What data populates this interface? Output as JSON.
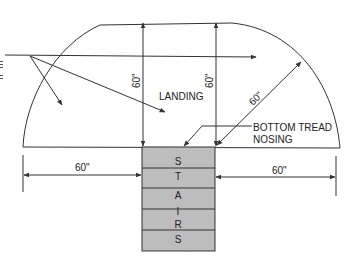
{
  "diagram": {
    "colors": {
      "line": "#333333",
      "stairs_fill": "#bdbdbd",
      "text": "#222222",
      "background": "#ffffff"
    },
    "labels": {
      "landing": "LANDING",
      "bottom_tread_nosing_line1": "BOTTOM TREAD",
      "bottom_tread_nosing_line2": "NOSING"
    },
    "dimensions": {
      "vertical_left": "60\"",
      "vertical_right": "60\"",
      "diagonal": "60\"",
      "horizontal_left": "60\"",
      "horizontal_right": "60\""
    },
    "stairs": {
      "letters": [
        "S",
        "T",
        "A",
        "I",
        "R",
        "S"
      ]
    },
    "left_edge_marks": [
      "≡",
      "≡"
    ]
  }
}
